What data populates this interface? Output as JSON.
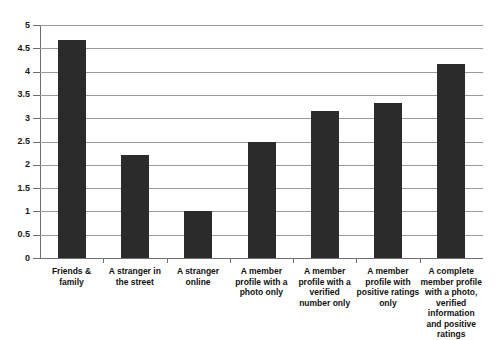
{
  "chart_data": {
    "type": "bar",
    "title": "",
    "subtitle": "",
    "xlabel": "",
    "ylabel": "",
    "ylim": [
      0,
      5
    ],
    "ytick_step": 0.5,
    "ytick_labels": [
      "5",
      "4.5",
      "4",
      "3.5",
      "3",
      "2.5",
      "2",
      "1.5",
      "1",
      "0.5",
      "0"
    ],
    "ytick_values": [
      5,
      4.5,
      4,
      3.5,
      3,
      2.5,
      2,
      1.5,
      1,
      0.5,
      0
    ],
    "grid": true,
    "legend": "none",
    "bar_color": "#2b2b2b",
    "grid_color": "#9a9a9a",
    "axis_color": "#6e6e6e",
    "categories": [
      "Friends & family",
      "A stranger in the street",
      "A stranger online",
      "A member profile with a photo only",
      "A member profile with a verified number only",
      "A member profile with positive ratings only",
      "A complete member profile with a photo, verified information and positive ratings"
    ],
    "values": [
      4.68,
      2.2,
      1.0,
      2.48,
      3.15,
      3.33,
      4.17
    ],
    "series": [
      {
        "name": "Trust rating",
        "values": [
          4.68,
          2.2,
          1.0,
          2.48,
          3.15,
          3.33,
          4.17
        ]
      }
    ]
  }
}
